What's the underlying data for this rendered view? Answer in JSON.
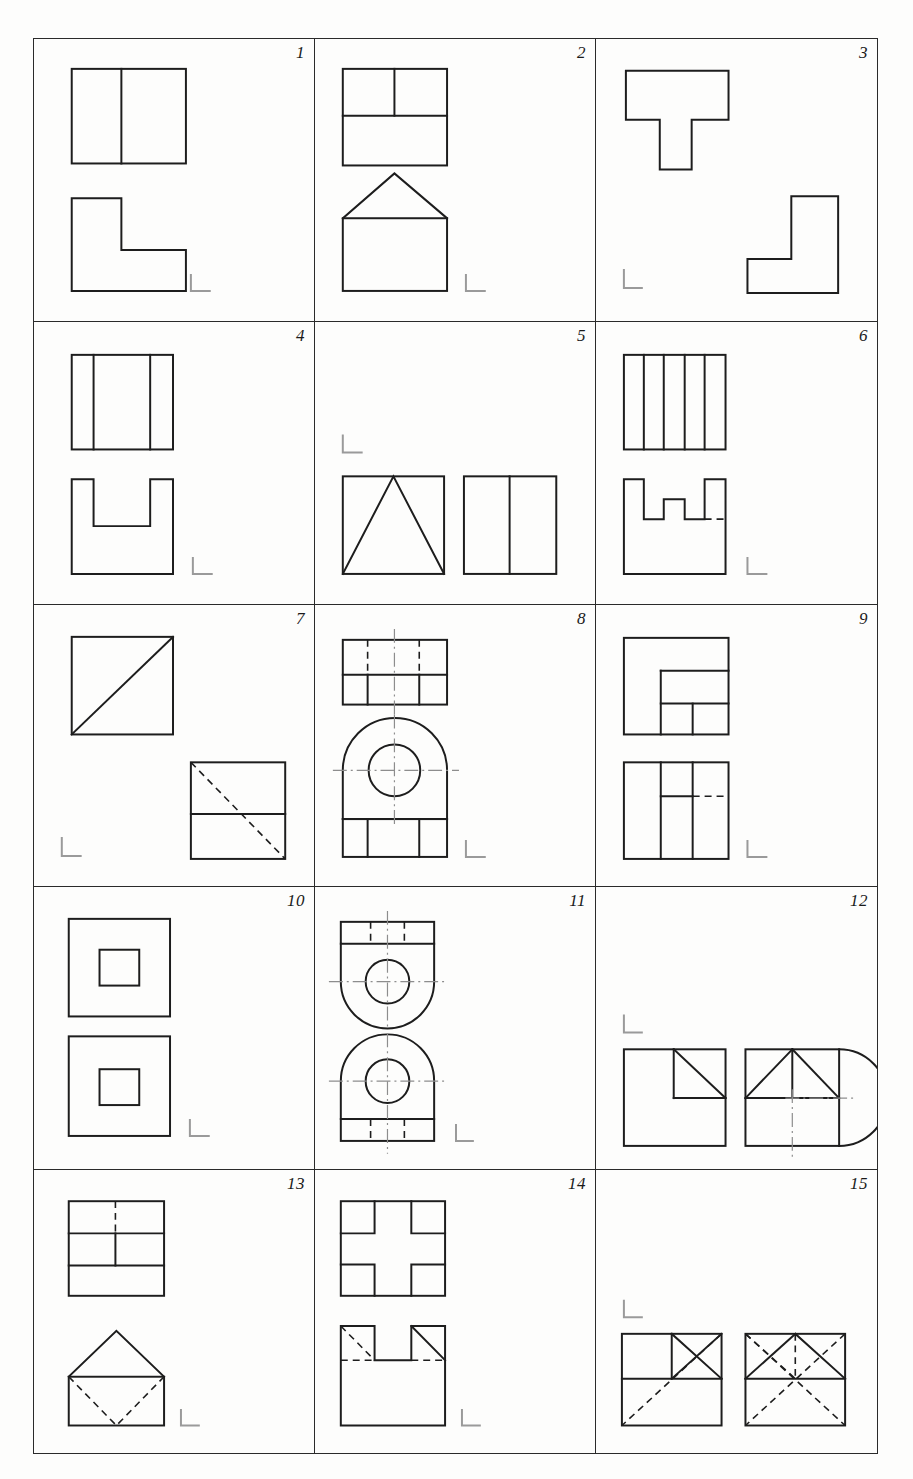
{
  "sheet": {
    "title": "Orthographic projection exercise sheet",
    "columns": 3,
    "rows": 5,
    "border_color": "#2a2a2a",
    "line_color": "#1d1d1d",
    "hidden_line_color": "#1d1d1d",
    "center_line_color": "#8d8d8d",
    "corner_mark_color": "#9a9a9a",
    "background": "#fdfdfc"
  },
  "cells": [
    {
      "number": "1",
      "description": "Top view: rectangle split by one vertical line. Front view: L-shaped block.",
      "corner_mark": "bottom-right",
      "views": [
        "divided-rectangle",
        "L-shape"
      ]
    },
    {
      "number": "2",
      "description": "Top view: square with horizontal division and vertical line in the upper band. Front view: house shape, rectangle with triangular roof.",
      "corner_mark": "bottom-right",
      "views": [
        "square-with-tee-division",
        "house-shape"
      ]
    },
    {
      "number": "3",
      "description": "Upper-left: T-shaped view. Lower-right: L-shaped view.",
      "corner_mark": "bottom-left",
      "views": [
        "T-shape",
        "L-shape"
      ]
    },
    {
      "number": "4",
      "description": "Top view: square with two vertical division lines. Front view: square with a rectangular notch cut into the top edge.",
      "corner_mark": "bottom-right",
      "views": [
        "square-three-bands",
        "square-with-top-notch"
      ]
    },
    {
      "number": "5",
      "description": "Front view: square with inscribed triangle. Side view: square split by one vertical line. Both placed on lower half.",
      "corner_mark": "top-left",
      "views": [
        "square-with-triangle",
        "square-split-vertical"
      ]
    },
    {
      "number": "6",
      "description": "Top view: square divided by four vertical lines. Front view: crenellated block with two slots, one hidden edge dashed on the right.",
      "corner_mark": "bottom-right",
      "views": [
        "square-five-bands",
        "crenellated-block"
      ]
    },
    {
      "number": "7",
      "description": "Upper-left: square with solid diagonal rising to the right. Lower-right: square with horizontal division and a hidden dashed diagonal descending to the right.",
      "corner_mark": "bottom-left",
      "views": [
        "square-with-diagonal",
        "square-with-hidden-diagonal"
      ]
    },
    {
      "number": "8",
      "description": "Top view: rectangle in two bands, upper band with two hidden dashed lines, lower band split into three. Front view: arch shaped body with a central circle and center lines, base split into three panels.",
      "corner_mark": "bottom-right",
      "views": [
        "banded-rectangle-with-hidden-lines",
        "arched-body-with-hole"
      ]
    },
    {
      "number": "9",
      "description": "Top view: square with a stepped rectangular pocket divided into panels. Front view: square with two vertical lines and a partly hidden horizontal line.",
      "corner_mark": "bottom-right",
      "views": [
        "square-with-stepped-pocket",
        "square-with-hidden-horizontal"
      ]
    },
    {
      "number": "10",
      "description": "Two identical square views, each with a small concentric square at the centre.",
      "corner_mark": "bottom-right",
      "views": [
        "square-with-centre-square",
        "square-with-centre-square"
      ]
    },
    {
      "number": "11",
      "description": "Two mirrored bracket views, each a tapered body with a round end, central circular hole and hidden dashed lines in the flange. Center lines shown.",
      "corner_mark": "bottom-right",
      "views": [
        "bracket-flange-down",
        "bracket-flange-up"
      ]
    },
    {
      "number": "12",
      "description": "Left: square with a smaller square and diagonal in the upper-right corner. Right: square with corner diagonals and a semicircular boss projecting to the right, with center lines.",
      "corner_mark": "top-left",
      "views": [
        "square-with-corner-cut",
        "square-with-semicircular-boss"
      ]
    },
    {
      "number": "13",
      "description": "Top view: rectangle in three bands, hidden dashed vertical in the top band and a solid vertical in the middle band. Front view: house shape with a hidden dashed V inside.",
      "corner_mark": "bottom-right",
      "views": [
        "three-band-rectangle",
        "house-with-hidden-vee"
      ]
    },
    {
      "number": "14",
      "description": "Top view: square with a cross or plus shaped channel. Front view: square with a central top notch, hidden dashed diagonal on the left, solid diagonal on the right and a hidden horizontal line.",
      "corner_mark": "bottom-right",
      "views": [
        "square-with-plus-channel",
        "notched-square-with-chamfers"
      ]
    },
    {
      "number": "15",
      "description": "Left: square with horizontal division, solid X in the upper-right quarter and a hidden dashed diagonal to the lower-left corner. Right: square with horizontal division, solid triangles above and hidden dashed diagonals crossing the whole view.",
      "corner_mark": "top-left",
      "views": [
        "square-with-x-and-hidden-diagonal",
        "square-with-triangles-and-hidden-diagonals"
      ]
    }
  ]
}
